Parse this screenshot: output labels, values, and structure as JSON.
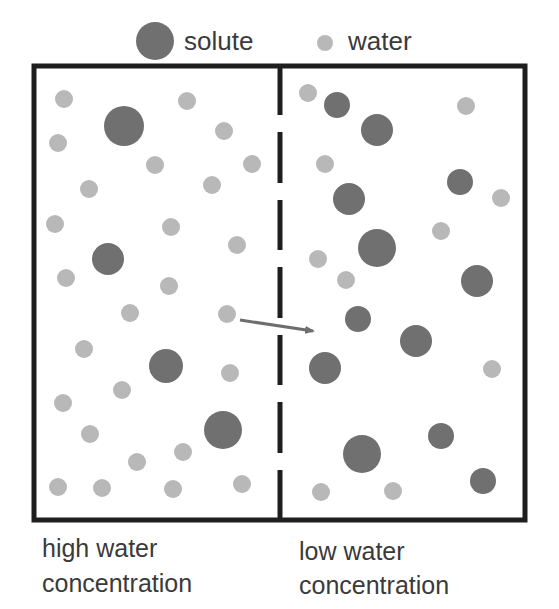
{
  "legend": {
    "solute_label": "solute",
    "water_label": "water"
  },
  "labels": {
    "left_line1": "high water",
    "left_line2": "concentration",
    "right_line1": "low water",
    "right_line2": "concentration"
  },
  "colors": {
    "solute": "#707070",
    "water": "#b8b8b8",
    "border": "#1e1e1e",
    "arrow": "#6e6e6e",
    "text": "#3a3a3a"
  },
  "box": {
    "x": 34,
    "y": 66,
    "width": 491,
    "height": 454,
    "membrane_x": 280
  },
  "membrane_dashes": [
    [
      66,
      115
    ],
    [
      132,
      183
    ],
    [
      200,
      250
    ],
    [
      267,
      318
    ],
    [
      335,
      385
    ],
    [
      402,
      453
    ],
    [
      470,
      520
    ]
  ],
  "arrow": {
    "x1": 240,
    "y1": 320,
    "x2": 313,
    "y2": 331
  },
  "compartments": {
    "left": {
      "description": "high water concentration",
      "water": [
        [
          64,
          99
        ],
        [
          187,
          101
        ],
        [
          58,
          143
        ],
        [
          224,
          131
        ],
        [
          155,
          165
        ],
        [
          252,
          164
        ],
        [
          89,
          189
        ],
        [
          212,
          185
        ],
        [
          55,
          224
        ],
        [
          171,
          227
        ],
        [
          237,
          245
        ],
        [
          66,
          278
        ],
        [
          169,
          286
        ],
        [
          130,
          313
        ],
        [
          227,
          314
        ],
        [
          84,
          349
        ],
        [
          122,
          390
        ],
        [
          230,
          373
        ],
        [
          63,
          403
        ],
        [
          90,
          434
        ],
        [
          183,
          452
        ],
        [
          137,
          462
        ],
        [
          58,
          487
        ],
        [
          102,
          488
        ],
        [
          173,
          489
        ],
        [
          242,
          484
        ]
      ],
      "solute": [
        [
          124,
          126,
          20
        ],
        [
          108,
          259,
          16
        ],
        [
          166,
          366,
          17
        ],
        [
          223,
          430,
          19
        ]
      ]
    },
    "right": {
      "description": "low water concentration",
      "water": [
        [
          308,
          93
        ],
        [
          466,
          106
        ],
        [
          325,
          164
        ],
        [
          501,
          198
        ],
        [
          441,
          231
        ],
        [
          318,
          259
        ],
        [
          346,
          280
        ],
        [
          492,
          369
        ],
        [
          321,
          492
        ],
        [
          393,
          491
        ]
      ],
      "solute": [
        [
          337,
          105,
          13
        ],
        [
          377,
          130,
          16
        ],
        [
          460,
          182,
          13
        ],
        [
          349,
          199,
          16
        ],
        [
          377,
          248,
          19
        ],
        [
          477,
          281,
          16
        ],
        [
          358,
          319,
          13
        ],
        [
          416,
          341,
          16
        ],
        [
          325,
          368,
          16
        ],
        [
          362,
          454,
          19
        ],
        [
          441,
          436,
          13
        ],
        [
          483,
          481,
          13
        ]
      ]
    }
  },
  "water_radius": 9
}
